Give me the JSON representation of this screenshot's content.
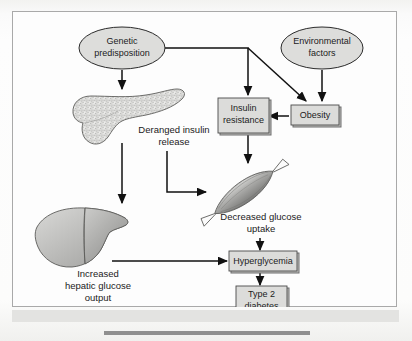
{
  "figure": {
    "kind": "flow-diagram",
    "nodes": {
      "genetic_predisposition": {
        "label": "Genetic\npredisposition",
        "line1": "Genetic",
        "line2": "predisposition",
        "shape": "ellipse"
      },
      "environmental_factors": {
        "label": "Environmental\nfactors",
        "line1": "Environmental",
        "line2": "factors",
        "shape": "ellipse"
      },
      "insulin_resistance": {
        "label": "Insulin\nresistance",
        "line1": "Insulin",
        "line2": "resistance",
        "shape": "box"
      },
      "obesity": {
        "label": "Obesity",
        "line1": "Obesity",
        "shape": "box"
      },
      "hyperglycemia": {
        "label": "Hyperglycemia",
        "line1": "Hyperglycemia",
        "shape": "box"
      },
      "type_2_diabetes": {
        "label": "Type 2\ndiabetes",
        "line1": "Type 2",
        "line2": "diabetes",
        "shape": "box"
      }
    },
    "organ_labels": {
      "deranged_insulin_release": {
        "line1": "Deranged insulin",
        "line2": "release"
      },
      "decreased_glucose_uptake": {
        "line1": "Decreased glucose",
        "line2": "uptake"
      },
      "increased_hepatic_glucose_output": {
        "line1": "Increased",
        "line2": "hepatic glucose",
        "line3": "output"
      }
    },
    "organs": {
      "pancreas": "pancreas-illustration",
      "skeletal_muscle": "skeletal-muscle-illustration",
      "liver": "liver-illustration"
    },
    "edges": [
      {
        "from": "genetic_predisposition",
        "to": "pancreas",
        "style": "straight-down"
      },
      {
        "from": "genetic_predisposition",
        "to": "insulin_resistance",
        "style": "elbow-right-down"
      },
      {
        "from": "genetic_predisposition",
        "to": "obesity",
        "style": "diagonal-down-right"
      },
      {
        "from": "environmental_factors",
        "to": "obesity",
        "style": "straight-down"
      },
      {
        "from": "obesity",
        "to": "insulin_resistance",
        "style": "straight-left"
      },
      {
        "from": "insulin_resistance",
        "to": "skeletal_muscle",
        "style": "straight-down"
      },
      {
        "from": "pancreas",
        "to": "liver",
        "style": "straight-down"
      },
      {
        "from": "deranged_insulin_release",
        "to": "skeletal_muscle",
        "style": "elbow-down-right"
      },
      {
        "from": "liver",
        "to": "hyperglycemia",
        "style": "straight-right"
      },
      {
        "from": "decreased_glucose_uptake",
        "to": "hyperglycemia",
        "style": "straight-down"
      },
      {
        "from": "hyperglycemia",
        "to": "type_2_diabetes",
        "style": "straight-down"
      }
    ],
    "colors": {
      "node_fill": "#dddddb",
      "box_shadow_fill": "#bdbdbb",
      "outline": "#2b2b2b",
      "connector": "#111111",
      "frame_border": "#a9a9a9",
      "page_background": "#fbfbfa",
      "below_bar": "#e3e3e1",
      "caption_rule": "#8f8f8f",
      "organ_light": "#d2d2d0",
      "organ_mid": "#a8a8a6",
      "organ_dark": "#7d7d7b"
    }
  }
}
